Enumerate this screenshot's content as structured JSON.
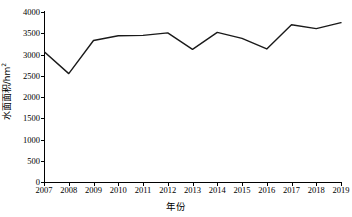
{
  "chart_data": {
    "type": "line",
    "title": "",
    "xlabel": "年份",
    "ylabel": "水面面积/hm",
    "ylabel_superscript": "2",
    "categories": [
      "2007",
      "2008",
      "2009",
      "2010",
      "2011",
      "2012",
      "2013",
      "2014",
      "2015",
      "2016",
      "2017",
      "2018",
      "2019"
    ],
    "x": [
      2007,
      2008,
      2009,
      2010,
      2011,
      2012,
      2013,
      2014,
      2015,
      2016,
      2017,
      2018,
      2019
    ],
    "values": [
      3070,
      2550,
      3330,
      3440,
      3450,
      3510,
      3120,
      3520,
      3380,
      3130,
      3700,
      3610,
      3750
    ],
    "series": [
      {
        "name": "水面面积",
        "values": [
          3070,
          2550,
          3330,
          3440,
          3450,
          3510,
          3120,
          3520,
          3380,
          3130,
          3700,
          3610,
          3750
        ]
      }
    ],
    "ylim": [
      0,
      4000
    ],
    "yticks": [
      0,
      500,
      1000,
      1500,
      2000,
      2500,
      3000,
      3500,
      4000
    ],
    "ytick_labels": [
      "0",
      "500",
      "1000",
      "1500",
      "2000",
      "2500",
      "3000",
      "3500",
      "4000"
    ],
    "grid": false,
    "legend": false,
    "legend_position": "none",
    "line_color": "#1a1a1a",
    "background_color": "#ffffff",
    "markers": false
  }
}
